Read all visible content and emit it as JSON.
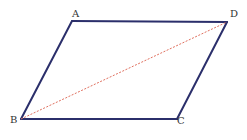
{
  "diagram": {
    "type": "parallelogram",
    "colors": {
      "side": "#2b2f6b",
      "diagonal": "#e0705f",
      "label": "#333333",
      "background": "#ffffff"
    },
    "vertices": [
      {
        "name": "A",
        "x": 72,
        "y": 21,
        "label_x": 72,
        "label_y": 17
      },
      {
        "name": "D",
        "x": 227,
        "y": 22,
        "label_x": 230,
        "label_y": 17
      },
      {
        "name": "C",
        "x": 177,
        "y": 119,
        "label_x": 177,
        "label_y": 124
      },
      {
        "name": "B",
        "x": 21,
        "y": 119,
        "label_x": 10,
        "label_y": 123
      }
    ],
    "sides": [
      [
        "A",
        "D"
      ],
      [
        "D",
        "C"
      ],
      [
        "C",
        "B"
      ],
      [
        "B",
        "A"
      ]
    ],
    "diagonals": [
      [
        "B",
        "D"
      ]
    ]
  }
}
